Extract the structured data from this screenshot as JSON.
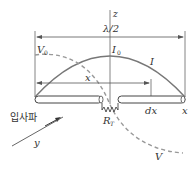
{
  "diagram": {
    "labels": {
      "z_axis": "z",
      "half_wavelength": "λ/2",
      "v0": "V",
      "v0_sub": "0",
      "i0": "I",
      "i0_sub": "0",
      "current": "I",
      "voltage": "V",
      "x_distance": "x",
      "dx": "dx",
      "x_axis": "x",
      "y_axis": "y",
      "load_resistor": "R",
      "load_resistor_sub": "T",
      "incident_wave": "입사파"
    },
    "colors": {
      "line": "#555555",
      "curve": "#777777",
      "dashed": "#999999",
      "text": "#333333"
    }
  }
}
